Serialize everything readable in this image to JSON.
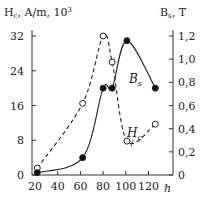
{
  "chart_data": {
    "type": "line",
    "title": "",
    "xlabel": "h",
    "ylabel_left": "H_c, A/m, 10^3",
    "ylabel_right": "B_s, T",
    "x_ticks": [
      "20",
      "40",
      "60",
      "80",
      "100",
      "120"
    ],
    "y_left_ticks": [
      "0",
      "8",
      "16",
      "24",
      "32"
    ],
    "y_right_ticks": [
      "0",
      "0,2",
      "0,4",
      "0,6",
      "0,8",
      "1,0",
      "1,2"
    ],
    "xlim": [
      20,
      130
    ],
    "ylim_left": [
      0,
      32
    ],
    "ylim_right": [
      0,
      1.2
    ],
    "series": [
      {
        "name": "Hc",
        "axis": "left",
        "style": "dashed",
        "marker": "open-circle",
        "x": [
          22,
          62,
          80,
          88,
          101,
          126
        ],
        "values": [
          1.6,
          16.5,
          32,
          26,
          7.8,
          11.7
        ]
      },
      {
        "name": "Bs",
        "axis": "right",
        "style": "solid",
        "marker": "filled-circle",
        "x": [
          22,
          62,
          80,
          88,
          101,
          126
        ],
        "values": [
          0.02,
          0.15,
          0.75,
          0.75,
          1.16,
          0.75
        ]
      }
    ],
    "annotations": [
      "B_s",
      "H_c"
    ]
  },
  "labels": {
    "left_axis": "H",
    "left_axis_sub": "c",
    "left_axis_rest": ", A/m, 10",
    "left_axis_sup": "3",
    "right_axis": "B",
    "right_axis_sub": "s",
    "right_axis_rest": ", T",
    "x_axis": "h",
    "bs_label": "B",
    "bs_sub": "s",
    "hc_label": "H",
    "hc_sub": "c"
  }
}
